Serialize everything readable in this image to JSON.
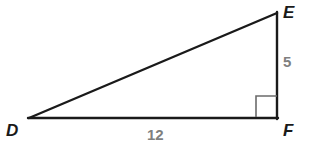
{
  "figure": {
    "kind": "right-triangle-diagram",
    "background_color": "#ffffff",
    "stroke_color": "#1a1a1a",
    "label_color": "#1a1a1a",
    "measure_color": "#7f7f7f",
    "right_angle_color": "#6b6b6b",
    "vertices": {
      "D": {
        "label": "D",
        "x": 29,
        "y": 118
      },
      "E": {
        "label": "E",
        "x": 277,
        "y": 13
      },
      "F": {
        "label": "F",
        "x": 277,
        "y": 118
      }
    },
    "sides": [
      {
        "name": "DF",
        "label": "12",
        "from": "D",
        "to": "F",
        "kind": "leg"
      },
      {
        "name": "EF",
        "label": "5",
        "from": "E",
        "to": "F",
        "kind": "leg"
      },
      {
        "name": "DE",
        "label": "",
        "from": "D",
        "to": "E",
        "kind": "hypotenuse"
      }
    ],
    "right_angle": {
      "at_vertex": "F",
      "marker": "square",
      "size": 21
    }
  }
}
